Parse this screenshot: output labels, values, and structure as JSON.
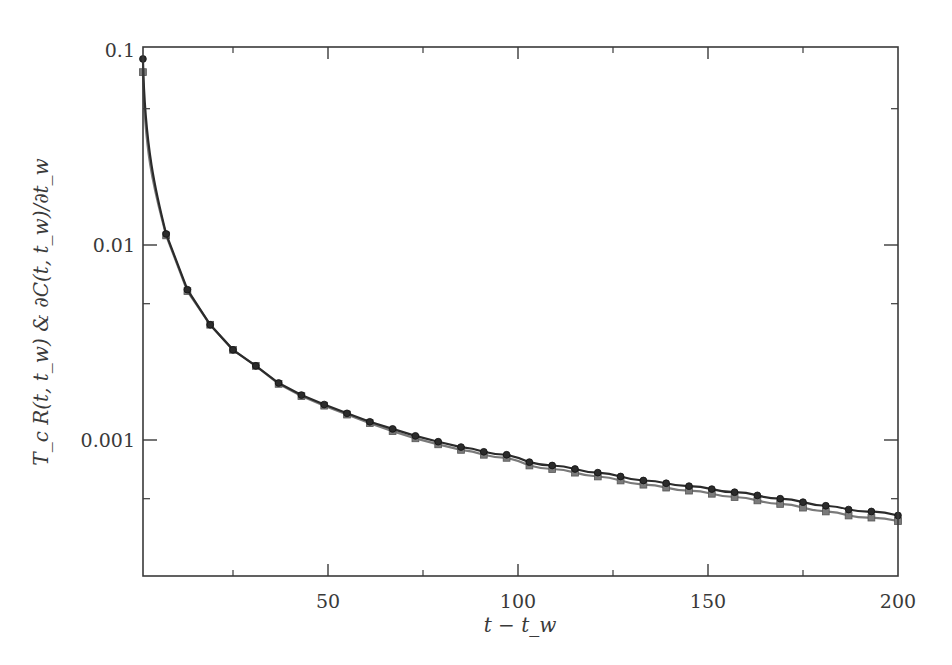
{
  "chart_data": {
    "type": "line",
    "title": "",
    "xlabel": "t − t_w",
    "ylabel": "T_c R(t, t_w) & ∂C(t, t_w)/∂t_w",
    "yscale": "log",
    "xlim": [
      1,
      200
    ],
    "ylim": [
      0.0002,
      0.1
    ],
    "grid": false,
    "legend": null,
    "x_ticks": [
      50,
      100,
      150,
      200
    ],
    "x_tick_labels": [
      "50",
      "100",
      "150",
      "200"
    ],
    "x_minor_ticks": [
      25,
      75,
      125,
      175
    ],
    "y_ticks": [
      0.1,
      0.01,
      0.001
    ],
    "y_tick_labels": [
      "0.1",
      "0.01",
      "0.001"
    ],
    "y_minor_ticks": [
      0.05,
      0.005,
      0.0005
    ],
    "x": [
      1.3,
      7.4,
      13,
      19,
      25,
      31,
      37,
      43,
      49,
      55,
      61,
      67,
      73,
      79,
      85,
      91,
      97,
      103,
      109,
      115,
      121,
      127,
      133,
      139,
      145,
      151,
      157,
      163,
      169,
      175,
      181,
      187,
      193,
      200
    ],
    "series": [
      {
        "name": "T_c R(t, t_w)",
        "marker": "circle",
        "color": "#2b2b2b",
        "values": [
          0.09,
          0.0114,
          0.0059,
          0.0039,
          0.0029,
          0.0024,
          0.00196,
          0.0017,
          0.00152,
          0.00137,
          0.00124,
          0.00114,
          0.00105,
          0.00098,
          0.00092,
          0.00087,
          0.00084,
          0.00077,
          0.00074,
          0.00071,
          0.00068,
          0.00065,
          0.00062,
          0.0006,
          0.00058,
          0.00056,
          0.00054,
          0.00052,
          0.0005,
          0.00048,
          0.00046,
          0.00044,
          0.00043,
          0.00041
        ]
      },
      {
        "name": "∂C(t, t_w)/∂t_w",
        "marker": "square",
        "color": "#7a7a7a",
        "values": [
          0.077,
          0.0112,
          0.0058,
          0.0039,
          0.0029,
          0.0024,
          0.00194,
          0.00168,
          0.0015,
          0.00135,
          0.00122,
          0.00111,
          0.00102,
          0.00095,
          0.00089,
          0.00084,
          0.00081,
          0.00074,
          0.00071,
          0.00068,
          0.00065,
          0.00062,
          0.00059,
          0.00057,
          0.00055,
          0.00053,
          0.00051,
          0.00049,
          0.00047,
          0.00045,
          0.00043,
          0.00041,
          0.0004,
          0.000384
        ]
      }
    ]
  }
}
